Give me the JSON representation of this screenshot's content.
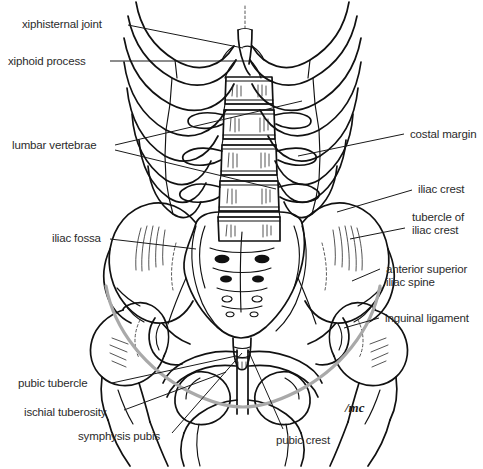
{
  "figure": {
    "width": 483,
    "height": 469,
    "background_color": "#ffffff",
    "ink_color": "#111111",
    "ligament_color": "#a9a9a9",
    "label_color": "#2b2b2b",
    "signature": "/mc"
  },
  "labels": [
    {
      "id": "xiphisternal-joint",
      "text": "xiphisternal joint",
      "side": "left",
      "x": 22,
      "y": 18,
      "line_x1": 128,
      "line_y1": 25,
      "line_x2": 243,
      "line_y2": 48
    },
    {
      "id": "xiphoid-process",
      "text": "xiphoid process",
      "side": "left",
      "x": 8,
      "y": 55,
      "line_x1": 110,
      "line_y1": 61,
      "line_x2": 249,
      "line_y2": 61
    },
    {
      "id": "lumbar-vertebrae",
      "text": "lumbar vertebrae",
      "side": "left",
      "x": 12,
      "y": 139,
      "line_x1": 115,
      "line_y1": 145,
      "line_x2": 302,
      "line_y2": 101,
      "line2_x1": 115,
      "line2_y1": 150,
      "line2_x2": 276,
      "line2_y2": 189
    },
    {
      "id": "iliac-fossa",
      "text": "iliac fossa",
      "side": "left",
      "x": 52,
      "y": 232,
      "line_x1": 110,
      "line_y1": 239,
      "line_x2": 196,
      "line_y2": 249
    },
    {
      "id": "pubic-tubercle",
      "text": "pubic tubercle",
      "side": "left",
      "x": 18,
      "y": 377,
      "line_x1": 112,
      "line_y1": 383,
      "line_x2": 236,
      "line_y2": 356
    },
    {
      "id": "ischial-tuberosity",
      "text": "ischial tuberosity",
      "side": "left",
      "x": 24,
      "y": 406,
      "line_x1": 124,
      "line_y1": 410,
      "line_x2": 226,
      "line_y2": 372
    },
    {
      "id": "symphysis-pubis",
      "text": "symphysis pubis",
      "side": "left",
      "x": 78,
      "y": 430,
      "line_x1": 172,
      "line_y1": 433,
      "line_x2": 242,
      "line_y2": 353
    },
    {
      "id": "pubic-crest",
      "text": "pubic crest",
      "side": "center",
      "x": 276,
      "y": 434,
      "line_x1": 283,
      "line_y1": 429,
      "line_x2": 248,
      "line_y2": 350
    },
    {
      "id": "costal-margin",
      "text": "costal margin",
      "side": "right",
      "x": 410,
      "y": 128,
      "line_x1": 404,
      "line_y1": 134,
      "line_x2": 298,
      "line_y2": 156
    },
    {
      "id": "iliac-crest",
      "text": "iliac crest",
      "side": "right",
      "x": 418,
      "y": 183,
      "line_x1": 412,
      "line_y1": 190,
      "line_x2": 337,
      "line_y2": 212
    },
    {
      "id": "tubercle-of-iliac-crest",
      "text": "tubercle of\niliac crest",
      "side": "right",
      "x": 412,
      "y": 211,
      "line_x1": 405,
      "line_y1": 228,
      "line_x2": 350,
      "line_y2": 239
    },
    {
      "id": "anterior-superior-iliac-spine",
      "text": "anterior superior\niliac spine",
      "side": "right",
      "x": 386,
      "y": 263,
      "line_x1": 380,
      "line_y1": 269,
      "line_x2": 352,
      "line_y2": 281
    },
    {
      "id": "inguinal-ligament",
      "text": "inguinal ligament",
      "side": "right",
      "x": 385,
      "y": 312,
      "line_x1": 379,
      "line_y1": 318,
      "line_x2": 344,
      "line_y2": 328
    }
  ],
  "structures": [
    {
      "id": "rib-cage",
      "name": "thoracic cage / ribs"
    },
    {
      "id": "costal-margin-arch",
      "name": "costal margin"
    },
    {
      "id": "sternum-xiphoid",
      "name": "xiphoid process and xiphisternal joint"
    },
    {
      "id": "lumbar-spine",
      "name": "lumbar vertebral column"
    },
    {
      "id": "sacrum",
      "name": "sacrum with sacral foramina"
    },
    {
      "id": "coccyx",
      "name": "coccyx"
    },
    {
      "id": "ilium-left",
      "name": "left iliac wing / iliac fossa"
    },
    {
      "id": "ilium-right",
      "name": "right iliac wing / iliac fossa"
    },
    {
      "id": "pubis",
      "name": "pubic bones and symphysis pubis"
    },
    {
      "id": "ischium",
      "name": "ischial tuberosities"
    },
    {
      "id": "obturator-foramen",
      "name": "obturator foramina"
    },
    {
      "id": "femur-left",
      "name": "left proximal femur"
    },
    {
      "id": "femur-right",
      "name": "right proximal femur"
    },
    {
      "id": "inguinal-ligament-curve",
      "name": "inguinal ligament (grey curve)"
    }
  ]
}
